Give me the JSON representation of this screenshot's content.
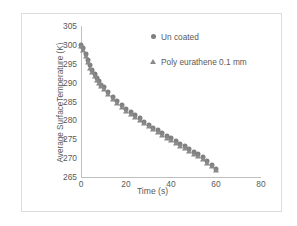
{
  "chart_data": {
    "type": "scatter",
    "title": "",
    "xlabel": "Time (s)",
    "ylabel": "Average SurfaceTemperature (K)",
    "xlim": [
      0,
      80
    ],
    "ylim": [
      265,
      305
    ],
    "xticks": [
      "0",
      "20",
      "40",
      "60",
      "80"
    ],
    "yticks": [
      "265",
      "270",
      "275",
      "280",
      "285",
      "290",
      "295",
      "300",
      "305"
    ],
    "grid": false,
    "legend_position": "upper-right-inside",
    "marker_color": "#7f7f7f",
    "axis_color": "#bfbfbf",
    "text_color": "#5a5a5a",
    "series": [
      {
        "name": "Un coated",
        "marker": "circle",
        "color": "#7f7f7f",
        "x": [
          0,
          1,
          2,
          3,
          4,
          5,
          6,
          7,
          8,
          9,
          10,
          12,
          14,
          16,
          18,
          20,
          22,
          24,
          26,
          28,
          30,
          32,
          34,
          36,
          38,
          40,
          42,
          44,
          46,
          48,
          50,
          52,
          54,
          56,
          58,
          60
        ],
        "y": [
          300.0,
          299.2,
          297.6,
          296.0,
          294.6,
          293.3,
          292.2,
          291.2,
          290.3,
          289.5,
          288.8,
          287.4,
          286.2,
          285.1,
          284.1,
          283.1,
          282.2,
          281.3,
          280.5,
          279.7,
          278.9,
          278.1,
          277.4,
          276.6,
          275.9,
          275.2,
          274.5,
          273.8,
          273.1,
          272.4,
          271.7,
          271.0,
          270.3,
          269.3,
          268.2,
          267.2
        ]
      },
      {
        "name": "Poly eurathene 0.1 mm",
        "marker": "triangle",
        "color": "#8a8a8a",
        "x": [
          0,
          1,
          2,
          3,
          4,
          5,
          6,
          7,
          8,
          9,
          10,
          12,
          14,
          16,
          18,
          20,
          22,
          24,
          26,
          28,
          30,
          32,
          34,
          36,
          38,
          40,
          42,
          44,
          46,
          48,
          50,
          52,
          54,
          56,
          58,
          60
        ],
        "y": [
          299.6,
          298.6,
          297.0,
          295.4,
          294.0,
          292.8,
          291.7,
          290.7,
          289.8,
          289.0,
          288.3,
          286.9,
          285.7,
          284.6,
          283.6,
          282.6,
          281.7,
          280.8,
          280.0,
          279.2,
          278.4,
          277.6,
          276.9,
          276.1,
          275.4,
          274.7,
          274.0,
          273.3,
          272.6,
          271.9,
          271.2,
          270.5,
          269.8,
          268.8,
          267.8,
          266.8
        ]
      }
    ]
  }
}
